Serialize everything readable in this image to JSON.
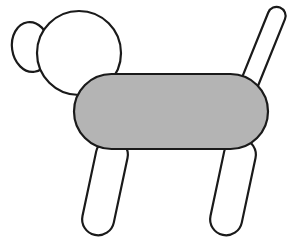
{
  "canvas": {
    "width": 301,
    "height": 241,
    "background_color": "#ffffff",
    "title": "Shape Dog Drawing"
  },
  "style": {
    "outline_color": "#1a1a1a",
    "fill_white": "#ffffff",
    "fill_gray": "#b4b4b4",
    "stroke_width": 2.2
  },
  "figure": {
    "name": "dog",
    "parts": [
      {
        "id": "ear",
        "label": "Ear",
        "shape": "ellipse",
        "fill": "#ffffff",
        "cx": 31,
        "cy": 47,
        "rx": 19,
        "ry": 25,
        "rotation": -8
      },
      {
        "id": "tail",
        "label": "Tail",
        "shape": "capsule",
        "fill": "#ffffff",
        "cx": 262,
        "cy": 52,
        "rx": 9,
        "ry": 48,
        "rotation": 22
      },
      {
        "id": "head",
        "label": "Head",
        "shape": "circle",
        "fill": "#ffffff",
        "cx": 79,
        "cy": 53,
        "r": 42,
        "rotation": 0
      },
      {
        "id": "front-leg",
        "label": "Front leg",
        "shape": "capsule",
        "fill": "#ffffff",
        "cx": 105,
        "cy": 187,
        "rx": 16,
        "ry": 49,
        "rotation": 12
      },
      {
        "id": "rear-leg",
        "label": "Rear leg",
        "shape": "capsule",
        "fill": "#ffffff",
        "cx": 233,
        "cy": 187,
        "rx": 16,
        "ry": 49,
        "rotation": 12
      },
      {
        "id": "body",
        "label": "Body",
        "shape": "stadium",
        "fill": "#b4b4b4",
        "x": 74,
        "y": 74,
        "width": 194,
        "height": 75,
        "corner_radius": 37.5,
        "rotation": 0
      }
    ]
  }
}
